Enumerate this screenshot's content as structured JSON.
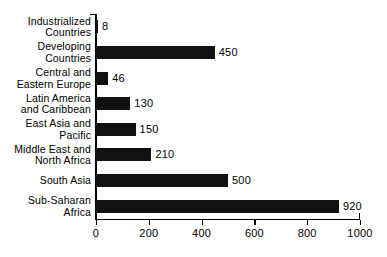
{
  "chart_data": {
    "type": "bar",
    "orientation": "horizontal",
    "title": "",
    "xlabel": "",
    "ylabel": "",
    "xlim": [
      0,
      1000
    ],
    "grid": false,
    "legend": null,
    "tick_labels": [
      "0",
      "200",
      "400",
      "600",
      "800",
      "1000"
    ],
    "ticks": [
      0,
      200,
      400,
      600,
      800,
      1000
    ],
    "categories": [
      "Industrialized\nCountries",
      "Developing\nCountries",
      "Central and\nEastern Europe",
      "Latin America\nand Caribbean",
      "East Asia and\nPacific",
      "Middle East and\nNorth Africa",
      "South Asia",
      "Sub-Saharan\nAfrica"
    ],
    "values": [
      8,
      450,
      46,
      130,
      150,
      210,
      500,
      920
    ],
    "value_labels": [
      "8",
      "450",
      "46",
      "130",
      "150",
      "210",
      "500",
      "920"
    ],
    "bar_color": "#111111",
    "axis_color": "#000000",
    "background_color": "#ffffff"
  }
}
